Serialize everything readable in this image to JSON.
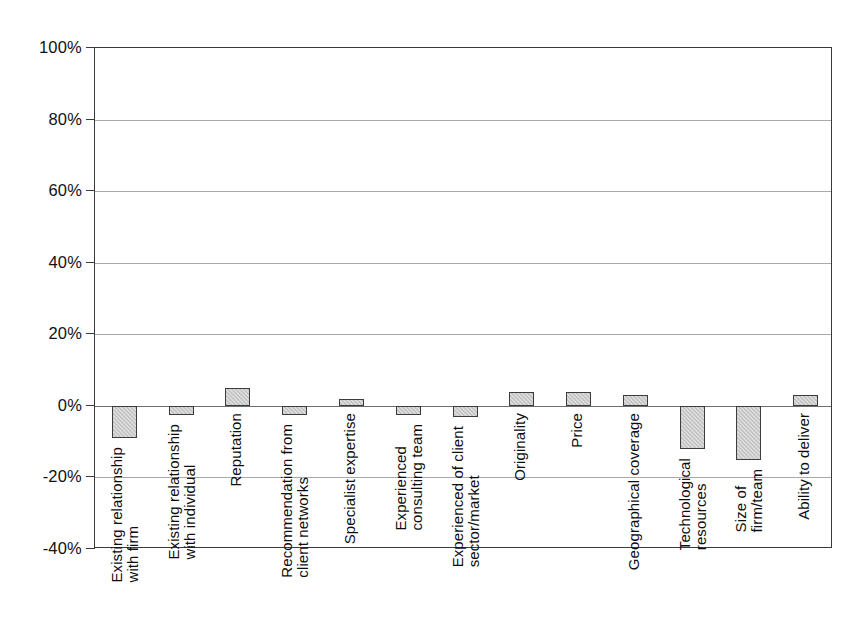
{
  "chart_data": {
    "type": "bar",
    "title": "",
    "subtitle": "",
    "xlabel": "",
    "ylabel": "",
    "ylim": [
      -40,
      100
    ],
    "grid": true,
    "legend": false,
    "orientation": "vertical",
    "ytick_labels": [
      "100%",
      "80%",
      "60%",
      "40%",
      "20%",
      "0%",
      "-20%",
      "-40%"
    ],
    "ytick_values": [
      100,
      80,
      60,
      40,
      20,
      0,
      -20,
      -40
    ],
    "categories": [
      "Existing relationship\nwith firm",
      "Existing relationship\nwith individual",
      "Reputation",
      "Recommendation from\nclient networks",
      "Specialist expertise",
      "Experienced\nconsulting team",
      "Experienced of client\nsector/market",
      "Originality",
      "Price",
      "Geographical coverage",
      "Technological\nresources",
      "Size of\nfirm/team",
      "Ability to deliver"
    ],
    "values": [
      -9,
      -2.5,
      5,
      -2.5,
      2,
      -2.5,
      -3,
      4,
      4,
      3,
      -12,
      -15,
      3
    ],
    "bar_color": "#dcdcdc",
    "bar_edge_color": "#3c3c3c",
    "axis_color": "#3a3a3a",
    "grid_color": "#a9a9a9",
    "zero_line_color": "#6e6e6e"
  }
}
